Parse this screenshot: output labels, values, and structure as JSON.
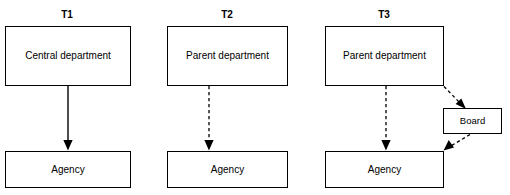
{
  "figure": {
    "clipped_top_text": "",
    "columns": [
      {
        "id": "t1",
        "label": "T1",
        "top_node": "Central department",
        "bottom_node": "Agency",
        "edges": [
          {
            "name": "central-department-to-agency",
            "style": "solid",
            "from": "Central department",
            "to": "Agency"
          }
        ]
      },
      {
        "id": "t2",
        "label": "T2",
        "top_node": "Parent department",
        "bottom_node": "Agency",
        "edges": [
          {
            "name": "parent-department-to-agency",
            "style": "dashed",
            "from": "Parent department",
            "to": "Agency"
          }
        ]
      },
      {
        "id": "t3",
        "label": "T3",
        "top_node": "Parent department",
        "bottom_node": "Agency",
        "side_node": "Board",
        "edges": [
          {
            "name": "parent-department-to-agency",
            "style": "dashed",
            "from": "Parent department",
            "to": "Agency"
          },
          {
            "name": "parent-department-to-board",
            "style": "dashed",
            "from": "Parent department",
            "to": "Board"
          },
          {
            "name": "board-to-agency",
            "style": "dashed",
            "from": "Board",
            "to": "Agency"
          }
        ]
      }
    ],
    "colors": {
      "stroke": "#000000",
      "fill": "#ffffff",
      "text": "#000000"
    }
  }
}
